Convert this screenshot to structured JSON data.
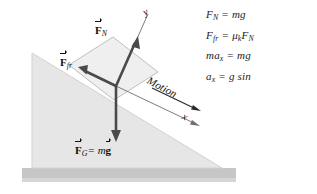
{
  "figure": {
    "colors": {
      "incline_fill": "#e6e6e6",
      "incline_stroke": "#cfcfcf",
      "ground_fill": "#c6c6c6",
      "block_fill": "#efefef",
      "block_stroke": "#b4b4b4",
      "vector_color": "#4a4a4a",
      "axis_color": "#5a5a5a",
      "text_color": "#111111",
      "background": "#ffffff"
    },
    "labels": {
      "normal_force": "F",
      "normal_force_sub": "N",
      "friction_force": "F",
      "friction_force_sub": "fr",
      "gravity_force": "F",
      "gravity_force_sub": "G",
      "gravity_equals": "= m",
      "gravity_g": "g",
      "axis_y": "y",
      "axis_x": "x",
      "motion": "Motion"
    }
  },
  "equations": [
    "Fₙ = mg",
    "Fғг = μₖFₙ",
    "maₓ = mg",
    "aₓ = g sin"
  ],
  "equations_plain": {
    "eq1": "F_N = mg",
    "eq2": "F_fr = μ_k F_N",
    "eq3": "ma_x = mg",
    "eq4": "a_x = g sin"
  }
}
